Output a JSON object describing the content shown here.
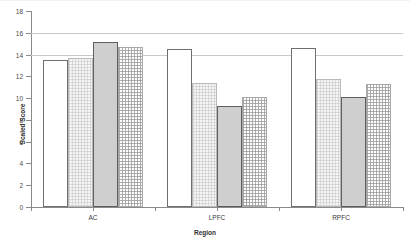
{
  "chart_data": {
    "type": "bar",
    "title": "",
    "xlabel": "Region",
    "ylabel": "Scaled Score",
    "categories": [
      "AC",
      "LPFC",
      "RPFC"
    ],
    "ylim": [
      0,
      18
    ],
    "yticks": [
      0,
      2,
      4,
      6,
      8,
      10,
      12,
      14,
      16,
      18
    ],
    "ytick_labels": [
      "0",
      "2",
      "4",
      "6",
      "8",
      "10",
      "12",
      "14",
      "16",
      "18"
    ],
    "grid": true,
    "grid_axis": "y",
    "legend": "none",
    "series": [
      {
        "name": "Series 1",
        "pattern": "plain",
        "values": [
          13.5,
          14.5,
          14.6
        ]
      },
      {
        "name": "Series 2",
        "pattern": "checkered",
        "values": [
          13.7,
          11.4,
          11.8
        ]
      },
      {
        "name": "Series 3",
        "pattern": "solid-gray",
        "values": [
          15.2,
          9.3,
          10.1
        ]
      },
      {
        "name": "Series 4",
        "pattern": "dotted",
        "values": [
          14.7,
          10.1,
          11.3
        ]
      }
    ]
  },
  "axes": {
    "y_title": "Scaled Score",
    "x_title": "Region"
  }
}
